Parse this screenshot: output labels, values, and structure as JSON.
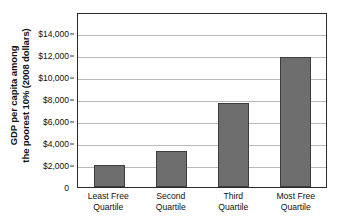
{
  "chart_data": {
    "type": "bar",
    "title": "",
    "subtitle": "",
    "xlabel": "",
    "ylabel": "GDP per capita among the poorest 10% (2008 dollars)",
    "ylabel_lines": [
      "GDP per capita among",
      "the poorest 10% (2008 dollars)"
    ],
    "categories": [
      "Least Free Quartile",
      "Second Quartile",
      "Third Quartile",
      "Most Free Quartile"
    ],
    "category_lines": [
      [
        "Least Free",
        "Quartile"
      ],
      [
        "Second",
        "Quartile"
      ],
      [
        "Third",
        "Quartile"
      ],
      [
        "Most Free",
        "Quartile"
      ]
    ],
    "values": [
      2000,
      3300,
      7600,
      11800
    ],
    "ylim": [
      0,
      15900
    ],
    "ytick_values": [
      0,
      2000,
      4000,
      6000,
      8000,
      10000,
      12000,
      14000
    ],
    "ytick_labels": [
      "0",
      "$2,000",
      "$4,000",
      "$6,000",
      "$8,000",
      "$10,000",
      "$12,000",
      "$14,000"
    ],
    "grid": true,
    "grid_axis": "y",
    "legend": false,
    "legend_position": "none",
    "bar_color": "#6e6e6e",
    "bar_edge_color": "#3d3d3d",
    "grid_color": "#b9b9b9",
    "frame_color": "#2b2b2b",
    "background_color": "#ffffff"
  }
}
